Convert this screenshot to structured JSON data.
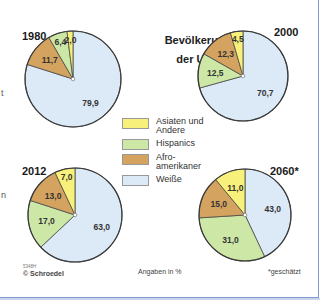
{
  "title": {
    "line1": "Bevölkerung",
    "line2": "der USA"
  },
  "legend": [
    {
      "label_line1": "Asiaten und",
      "label_line2": "Andere",
      "color": "#f7f07a"
    },
    {
      "label_line1": "Hispanics",
      "label_line2": "",
      "color": "#cde8a6"
    },
    {
      "label_line1": "Afro-",
      "label_line2": "amerikaner",
      "color": "#d4a35f"
    },
    {
      "label_line1": "Weiße",
      "label_line2": "",
      "color": "#dce9f6"
    }
  ],
  "footer": {
    "code": "5348H",
    "copyright": "© Schroedel",
    "unit_note": "Angaben in %",
    "estimate_note": "*geschätzt"
  },
  "edge_fragments": [
    "t",
    "n"
  ],
  "chart_data": [
    {
      "type": "pie",
      "title": "1980",
      "categories": [
        "Weiße",
        "Afroamerikaner",
        "Hispanics",
        "Asiaten und Andere"
      ],
      "values": [
        79.9,
        11.7,
        6.4,
        2.0
      ],
      "colors": [
        "#dce9f6",
        "#d4a35f",
        "#cde8a6",
        "#f7f07a"
      ],
      "unit": "%"
    },
    {
      "type": "pie",
      "title": "2000",
      "categories": [
        "Weiße",
        "Hispanics",
        "Afroamerikaner",
        "Asiaten und Andere"
      ],
      "values": [
        70.7,
        12.5,
        12.3,
        4.5
      ],
      "colors": [
        "#dce9f6",
        "#cde8a6",
        "#d4a35f",
        "#f7f07a"
      ],
      "unit": "%"
    },
    {
      "type": "pie",
      "title": "2012",
      "categories": [
        "Weiße",
        "Hispanics",
        "Afroamerikaner",
        "Asiaten und Andere"
      ],
      "values": [
        63.0,
        17.0,
        13.0,
        7.0
      ],
      "colors": [
        "#dce9f6",
        "#cde8a6",
        "#d4a35f",
        "#f7f07a"
      ],
      "unit": "%"
    },
    {
      "type": "pie",
      "title": "2060*",
      "categories": [
        "Weiße",
        "Hispanics",
        "Afroamerikaner",
        "Asiaten und Andere"
      ],
      "values": [
        43.0,
        31.0,
        15.0,
        11.0
      ],
      "colors": [
        "#dce9f6",
        "#cde8a6",
        "#d4a35f",
        "#f7f07a"
      ],
      "unit": "%",
      "note": "geschätzt"
    }
  ],
  "labels": {
    "1980": [
      "79,9",
      "11,7",
      "6,4",
      "2,0"
    ],
    "2000": [
      "70,7",
      "12,5",
      "12,3",
      "4,5"
    ],
    "2012": [
      "63,0",
      "17,0",
      "13,0",
      "7,0"
    ],
    "2060": [
      "43,0",
      "31,0",
      "15,0",
      "11,0"
    ]
  }
}
